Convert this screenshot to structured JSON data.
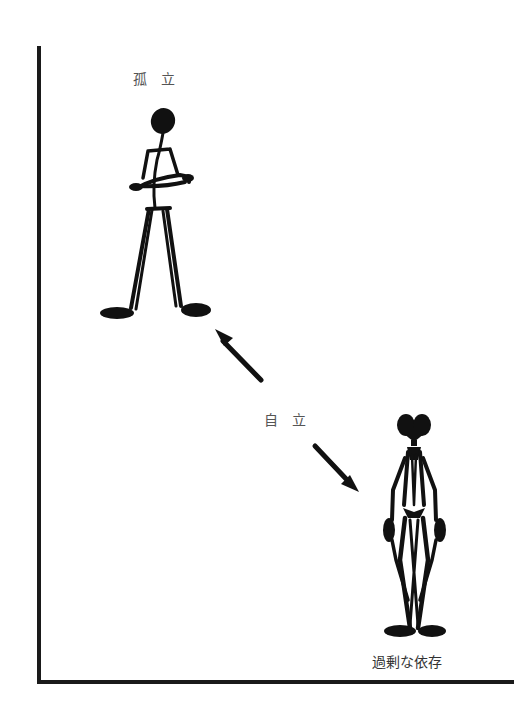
{
  "diagram": {
    "type": "conceptual-spectrum",
    "labels": {
      "top": "孤　立",
      "middle": "自　立",
      "bottom": "過剰な依存"
    },
    "figures": [
      {
        "name": "isolation-figure",
        "description": "single stick figure with arms crossed, standing alone"
      },
      {
        "name": "overdependence-figure",
        "description": "two stick figures fused together, leaning on each other"
      }
    ],
    "arrows": [
      {
        "name": "arrow-to-isolation",
        "direction": "up-left"
      },
      {
        "name": "arrow-to-overdependence",
        "direction": "down-right"
      }
    ],
    "colors": {
      "ink": "#111111",
      "label": "#555555",
      "axis": "#1a1a1a",
      "background": "#ffffff"
    }
  }
}
